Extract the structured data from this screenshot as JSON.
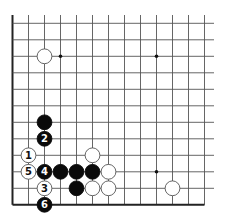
{
  "diagram": {
    "type": "go-board-fragment",
    "grid": {
      "columns": 13,
      "rows": 12,
      "origin_x": 12.5,
      "origin_y": 23.3,
      "spacing_x": 16.0,
      "spacing_y": 16.5,
      "right_extent": 214,
      "top_extent": 15,
      "left_edge_is_border": true,
      "bottom_edge_is_border": true
    },
    "star_points": [
      {
        "col": 3,
        "row": 2
      },
      {
        "col": 9,
        "row": 2
      },
      {
        "col": 9,
        "row": 9
      }
    ],
    "stones": [
      {
        "color": "white",
        "col": 2,
        "row": 2,
        "label": ""
      },
      {
        "color": "black",
        "col": 2,
        "row": 6,
        "label": ""
      },
      {
        "color": "black",
        "col": 2,
        "row": 7,
        "label": "2"
      },
      {
        "color": "white",
        "col": 1,
        "row": 8,
        "label": "1"
      },
      {
        "color": "white",
        "col": 5,
        "row": 8,
        "label": ""
      },
      {
        "color": "white",
        "col": 1,
        "row": 9,
        "label": "5"
      },
      {
        "color": "black",
        "col": 2,
        "row": 9,
        "label": "4"
      },
      {
        "color": "black",
        "col": 3,
        "row": 9,
        "label": ""
      },
      {
        "color": "black",
        "col": 4,
        "row": 9,
        "label": ""
      },
      {
        "color": "black",
        "col": 5,
        "row": 9,
        "label": ""
      },
      {
        "color": "white",
        "col": 6,
        "row": 9,
        "label": ""
      },
      {
        "color": "white",
        "col": 2,
        "row": 10,
        "label": "3"
      },
      {
        "color": "black",
        "col": 4,
        "row": 10,
        "label": ""
      },
      {
        "color": "white",
        "col": 5,
        "row": 10,
        "label": ""
      },
      {
        "color": "white",
        "col": 6,
        "row": 10,
        "label": ""
      },
      {
        "color": "white",
        "col": 10,
        "row": 10,
        "label": ""
      },
      {
        "color": "black",
        "col": 2,
        "row": 11,
        "label": "6"
      }
    ],
    "colors": {
      "line": "#555555",
      "border": "#222222",
      "black_stone": "#0a0a0a",
      "white_stone": "#ffffff",
      "white_outline": "#555555"
    }
  }
}
